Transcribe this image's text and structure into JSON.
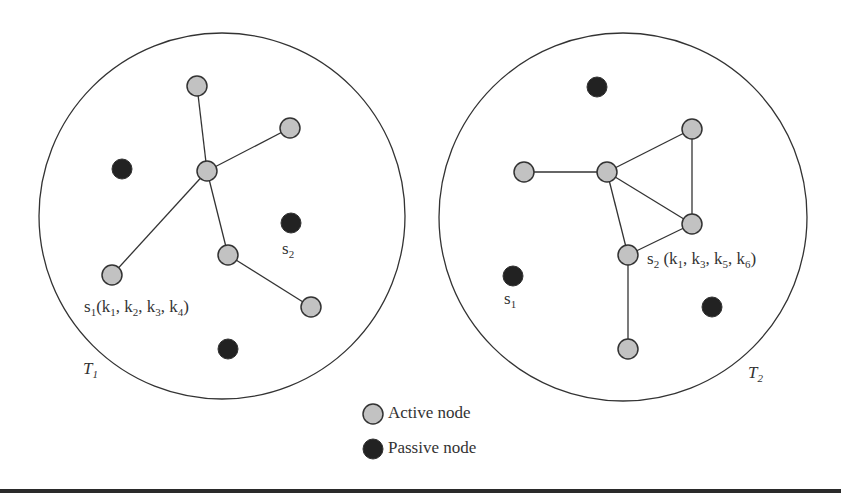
{
  "colors": {
    "active_fill": "#c2c2c2",
    "passive_fill": "#222222",
    "stroke": "#333333",
    "text": "#333333",
    "background": "#ffffff"
  },
  "regions": [
    {
      "id": "T1",
      "label_main": "T",
      "label_sub": "1",
      "circle": {
        "cx": 222,
        "cy": 216,
        "r": 183
      },
      "nodes": [
        {
          "id": "a1",
          "type": "active",
          "x": 197,
          "y": 86
        },
        {
          "id": "a2",
          "type": "active",
          "x": 290,
          "y": 128
        },
        {
          "id": "hub",
          "type": "active",
          "x": 207,
          "y": 171
        },
        {
          "id": "a3",
          "type": "active",
          "x": 228,
          "y": 255
        },
        {
          "id": "s1",
          "type": "active",
          "x": 112,
          "y": 275
        },
        {
          "id": "a4",
          "type": "active",
          "x": 311,
          "y": 307
        },
        {
          "id": "p1",
          "type": "passive",
          "x": 122,
          "y": 169
        },
        {
          "id": "s2",
          "type": "passive",
          "x": 291,
          "y": 223
        },
        {
          "id": "p2",
          "type": "passive",
          "x": 228,
          "y": 349
        }
      ],
      "edges": [
        [
          "hub",
          "a1"
        ],
        [
          "hub",
          "a2"
        ],
        [
          "hub",
          "s1"
        ],
        [
          "hub",
          "a3"
        ],
        [
          "a3",
          "a4"
        ]
      ],
      "node_labels": [
        {
          "node": "s1",
          "text": "s",
          "sub": "1",
          "keys": "(k1, k2, k3, k4)"
        },
        {
          "node": "s2",
          "text": "s",
          "sub": "2"
        }
      ]
    },
    {
      "id": "T2",
      "label_main": "T",
      "label_sub": "2",
      "circle": {
        "cx": 623,
        "cy": 217,
        "r": 184
      },
      "nodes": [
        {
          "id": "b1",
          "type": "active",
          "x": 524,
          "y": 172
        },
        {
          "id": "hub",
          "type": "active",
          "x": 607,
          "y": 172
        },
        {
          "id": "b2",
          "type": "active",
          "x": 692,
          "y": 129
        },
        {
          "id": "b3",
          "type": "active",
          "x": 692,
          "y": 224
        },
        {
          "id": "s2",
          "type": "active",
          "x": 628,
          "y": 255
        },
        {
          "id": "b4",
          "type": "active",
          "x": 628,
          "y": 349
        },
        {
          "id": "p1",
          "type": "passive",
          "x": 597,
          "y": 87
        },
        {
          "id": "s1",
          "type": "passive",
          "x": 513,
          "y": 276
        },
        {
          "id": "p2",
          "type": "passive",
          "x": 712,
          "y": 307
        }
      ],
      "edges": [
        [
          "b1",
          "hub"
        ],
        [
          "hub",
          "b2"
        ],
        [
          "b2",
          "b3"
        ],
        [
          "hub",
          "b3"
        ],
        [
          "hub",
          "s2"
        ],
        [
          "s2",
          "b3"
        ],
        [
          "s2",
          "b4"
        ]
      ],
      "node_labels": [
        {
          "node": "s2",
          "text": "s",
          "sub": "2",
          "keys": "(k1, k3, k5, k6)"
        },
        {
          "node": "s1",
          "text": "s",
          "sub": "1"
        }
      ]
    }
  ],
  "labels": {
    "t1_s1": {
      "base": "s",
      "sub": "1",
      "open": "(k",
      "k1": "1",
      "sep1": ", k",
      "k2": "2",
      "sep2": ", k",
      "k3": "3",
      "sep3": ", k",
      "k4": "4",
      "close": ")"
    },
    "t1_s2": {
      "base": "s",
      "sub": "2"
    },
    "t1_name": {
      "base": "T",
      "sub": "1"
    },
    "t2_s2": {
      "base": "s",
      "sub": "2",
      "open": " (k",
      "k1": "1",
      "sep1": ", k",
      "k2": "3",
      "sep2": ", k",
      "k3": "5",
      "sep3": ", k",
      "k4": "6",
      "close": ")"
    },
    "t2_s1": {
      "base": "s",
      "sub": "1"
    },
    "t2_name": {
      "base": "T",
      "sub": "2"
    }
  },
  "legend": {
    "items": [
      {
        "type": "active",
        "label": "Active node"
      },
      {
        "type": "passive",
        "label": "Passive node"
      }
    ]
  }
}
